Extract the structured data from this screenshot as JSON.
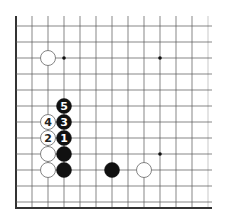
{
  "diagram": {
    "type": "go-board-fragment",
    "grid": {
      "origin_x": 16,
      "origin_y": 26,
      "spacing": 16,
      "cols": 13,
      "rows": 12,
      "left_edge_thick": true,
      "bottom_edge_thick": true,
      "line_color": "#555555",
      "edge_color": "#333333"
    },
    "star_points": [
      {
        "col": 3,
        "row": 2
      },
      {
        "col": 9,
        "row": 2
      },
      {
        "col": 9,
        "row": 8
      }
    ],
    "stones": [
      {
        "color": "white",
        "col": 2,
        "row": 2,
        "label": ""
      },
      {
        "color": "black",
        "col": 3,
        "row": 5,
        "label": "5"
      },
      {
        "color": "white",
        "col": 2,
        "row": 6,
        "label": "4"
      },
      {
        "color": "black",
        "col": 3,
        "row": 6,
        "label": "3"
      },
      {
        "color": "white",
        "col": 2,
        "row": 7,
        "label": "2"
      },
      {
        "color": "black",
        "col": 3,
        "row": 7,
        "label": "1"
      },
      {
        "color": "white",
        "col": 2,
        "row": 8,
        "label": ""
      },
      {
        "color": "black",
        "col": 3,
        "row": 8,
        "label": ""
      },
      {
        "color": "white",
        "col": 2,
        "row": 9,
        "label": ""
      },
      {
        "color": "black",
        "col": 3,
        "row": 9,
        "label": ""
      },
      {
        "color": "black",
        "col": 6,
        "row": 9,
        "label": ""
      },
      {
        "color": "white",
        "col": 8,
        "row": 9,
        "label": ""
      }
    ],
    "colors": {
      "black_stone": "#111111",
      "white_stone": "#ffffff",
      "white_stone_border": "#666666",
      "black_label": "#ffffff",
      "white_label": "#222222"
    }
  }
}
